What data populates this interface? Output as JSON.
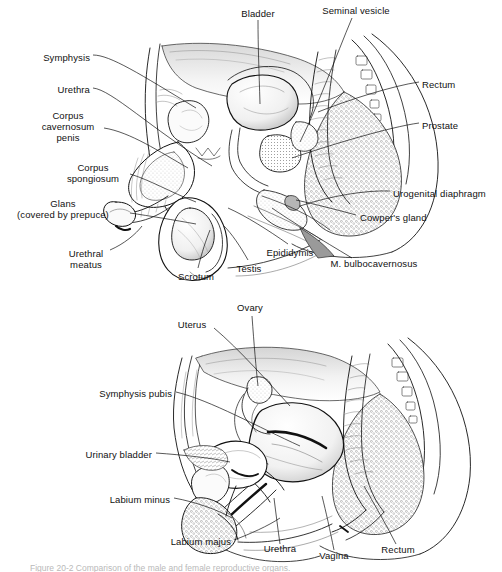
{
  "figure": {
    "title_visible": false,
    "caption": "Figure 20-2  Comparison of the male and female reproductive organs.",
    "background_color": "#ffffff",
    "ink_color": "#111111",
    "panels": [
      {
        "name": "male-pelvis-sagittal",
        "labels": [
          {
            "text": "Symphysis",
            "align": "right",
            "x": 90,
            "y": 58
          },
          {
            "text": "Urethra",
            "align": "right",
            "x": 90,
            "y": 90
          },
          {
            "text": "Corpus",
            "align": "center",
            "x": 68,
            "y": 115
          },
          {
            "text": "cavernosum",
            "align": "center",
            "x": 68,
            "y": 126
          },
          {
            "text": "penis",
            "align": "center",
            "x": 68,
            "y": 137
          },
          {
            "text": "Corpus",
            "align": "center",
            "x": 93,
            "y": 167
          },
          {
            "text": "spongiosum",
            "align": "center",
            "x": 93,
            "y": 178
          },
          {
            "text": "Glans",
            "align": "center",
            "x": 63,
            "y": 203
          },
          {
            "text": "(covered by prepuce)",
            "align": "center",
            "x": 63,
            "y": 215
          },
          {
            "text": "Urethral",
            "align": "center",
            "x": 86,
            "y": 253
          },
          {
            "text": "meatus",
            "align": "center",
            "x": 86,
            "y": 265
          },
          {
            "text": "Scrotum",
            "align": "center",
            "x": 196,
            "y": 277
          },
          {
            "text": "Testis",
            "align": "center",
            "x": 249,
            "y": 269
          },
          {
            "text": "Epididymis",
            "align": "center",
            "x": 290,
            "y": 253
          },
          {
            "text": "M. bulbocavernosus",
            "align": "center",
            "x": 374,
            "y": 264
          },
          {
            "text": "Cowper's gland",
            "align": "left",
            "x": 360,
            "y": 218
          },
          {
            "text": "Urogenital diaphragm",
            "align": "left",
            "x": 393,
            "y": 194
          },
          {
            "text": "Prostate",
            "align": "left",
            "x": 422,
            "y": 126
          },
          {
            "text": "Rectum",
            "align": "left",
            "x": 422,
            "y": 85
          },
          {
            "text": "Bladder",
            "align": "center",
            "x": 258,
            "y": 13
          },
          {
            "text": "Seminal vesicle",
            "align": "center",
            "x": 356,
            "y": 11
          }
        ]
      },
      {
        "name": "female-pelvis-sagittal",
        "labels": [
          {
            "text": "Ovary",
            "align": "center",
            "x": 250,
            "y": 308
          },
          {
            "text": "Uterus",
            "align": "center",
            "x": 192,
            "y": 325
          },
          {
            "text": "Symphysis pubis",
            "align": "right",
            "x": 172,
            "y": 394
          },
          {
            "text": "Urinary bladder",
            "align": "right",
            "x": 152,
            "y": 455
          },
          {
            "text": "Labium minus",
            "align": "right",
            "x": 170,
            "y": 500
          },
          {
            "text": "Labium majus",
            "align": "right",
            "x": 231,
            "y": 542
          },
          {
            "text": "Urethra",
            "align": "center",
            "x": 280,
            "y": 549
          },
          {
            "text": "Vagina",
            "align": "center",
            "x": 334,
            "y": 556
          },
          {
            "text": "Rectum",
            "align": "center",
            "x": 398,
            "y": 550
          }
        ]
      }
    ]
  }
}
